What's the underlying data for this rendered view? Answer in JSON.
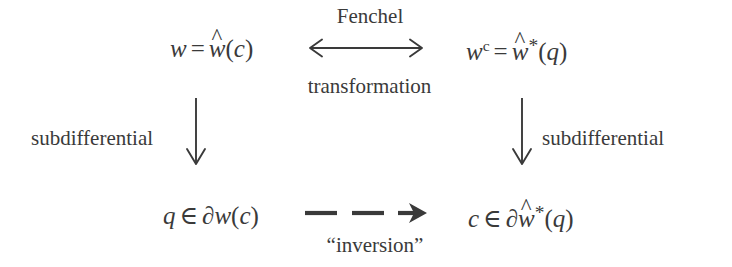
{
  "diagram": {
    "ink_color": "#3a3a3a",
    "background_color": "#ffffff",
    "nodes": {
      "top_left": {
        "text": "w = ŵ(c)",
        "parts": {
          "lhs": "w",
          "eq": "=",
          "fn": "w",
          "hat": "^",
          "open": "(",
          "arg": "c",
          "close": ")"
        }
      },
      "top_right": {
        "text": "wᶜ = ŵ*(q)",
        "parts": {
          "lhs": "w",
          "lhs_sup": "c",
          "eq": "=",
          "fn": "w",
          "hat": "^",
          "star": "*",
          "open": "(",
          "arg": "q",
          "close": ")"
        }
      },
      "bottom_left": {
        "text": "q ∈ ∂w(c)",
        "parts": {
          "lhs": "q",
          "rel": "∈",
          "del": "∂",
          "fn": "w",
          "open": "(",
          "arg": "c",
          "close": ")"
        }
      },
      "bottom_right": {
        "text": "c ∈ ∂ŵ*(q)",
        "parts": {
          "lhs": "c",
          "rel": "∈",
          "del": "∂",
          "fn": "w",
          "hat": "^",
          "star": "*",
          "open": "(",
          "arg": "q",
          "close": ")"
        }
      }
    },
    "labels": {
      "fenchel": "Fenchel",
      "transformation": "transformation",
      "subdifferential_left": "subdifferential",
      "subdifferential_right": "subdifferential",
      "inversion": "“inversion”"
    },
    "arrows": {
      "top_horizontal": {
        "style": "solid",
        "heads": "both",
        "direction": "horizontal"
      },
      "left_vertical": {
        "style": "solid",
        "heads": "end",
        "direction": "down"
      },
      "right_vertical": {
        "style": "solid",
        "heads": "end",
        "direction": "down"
      },
      "bottom_horizontal": {
        "style": "dashed",
        "heads": "end",
        "direction": "right"
      }
    }
  }
}
